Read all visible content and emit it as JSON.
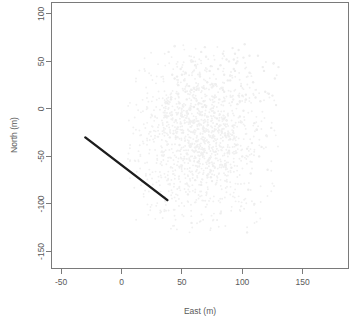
{
  "figure": {
    "background_color": "#ffffff",
    "frame_color": "#7a7a7a",
    "text_color": "#5a5a5a"
  },
  "chart_data": {
    "type": "scatter",
    "title": "",
    "subtitle": "",
    "xlabel": "East (m)",
    "ylabel": "North (m)",
    "xlim": [
      -58,
      188
    ],
    "ylim": [
      -168,
      112
    ],
    "xticks": [
      -50,
      0,
      50,
      100,
      150
    ],
    "xticklabels": [
      "-50",
      "0",
      "50",
      "100",
      "150"
    ],
    "yticks": [
      100,
      50,
      0,
      -50,
      -100,
      -150
    ],
    "yticklabels": [
      "100",
      "50",
      "0",
      "-50",
      "-100",
      "-150"
    ],
    "grid": false,
    "legend": null,
    "legend_position": "none",
    "frame": "box",
    "series": [
      {
        "name": "point-cloud",
        "type": "scatter",
        "color": "#ededed",
        "marker": "point",
        "marker_size": 1.2,
        "note": "very faint light-gray diffuse cloud of points",
        "x": [
          62,
          74,
          81,
          55,
          90,
          68,
          47,
          96,
          72,
          59,
          85,
          103,
          66,
          51,
          78,
          94,
          110,
          63,
          45,
          88,
          100,
          70,
          57,
          83,
          115,
          76,
          41,
          92,
          106,
          64,
          53,
          80,
          98,
          120,
          69,
          48,
          87,
          109,
          74,
          60,
          95,
          112,
          67,
          44,
          84,
          101,
          125,
          71,
          56,
          90,
          117,
          79,
          38,
          93,
          104,
          65,
          50,
          86,
          122,
          75,
          43,
          97,
          108,
          61,
          54,
          82,
          99,
          128,
          73,
          46,
          89,
          113,
          77,
          58,
          91,
          118,
          68,
          40,
          85,
          102,
          66,
          52,
          79,
          96,
          124,
          70,
          49,
          88,
          111,
          76,
          62,
          94,
          107,
          64,
          42,
          83,
          100,
          130,
          72,
          57,
          87,
          116,
          78,
          45,
          92,
          105,
          60,
          53,
          81,
          98,
          126,
          74,
          47,
          90,
          114,
          69,
          39,
          86,
          103,
          65,
          55,
          84,
          101,
          121,
          71,
          50,
          93,
          110,
          77,
          61,
          95,
          119,
          67,
          44,
          82,
          99,
          127,
          75,
          48,
          89,
          112,
          73,
          58,
          97,
          106,
          63,
          41,
          85,
          104,
          68
        ],
        "y": [
          20,
          45,
          10,
          -5,
          35,
          -20,
          25,
          5,
          -35,
          50,
          -10,
          15,
          60,
          -25,
          -45,
          40,
          -15,
          0,
          -30,
          30,
          -50,
          55,
          -40,
          22,
          8,
          -60,
          12,
          -18,
          38,
          -55,
          18,
          42,
          -8,
          -28,
          65,
          -38,
          -12,
          28,
          -65,
          2,
          48,
          -22,
          -48,
          32,
          58,
          -2,
          14,
          -70,
          24,
          -32,
          44,
          -16,
          6,
          52,
          -42,
          -6,
          36,
          -58,
          16,
          26,
          -26,
          62,
          -36,
          -75,
          10,
          46,
          -14,
          4,
          -52,
          34,
          -44,
          56,
          -4,
          20,
          -62,
          40,
          8,
          -30,
          18,
          68,
          -80,
          30,
          -10,
          50,
          -20,
          2,
          42,
          -46,
          12,
          24,
          -34,
          58,
          -68,
          6,
          36,
          -24,
          14,
          44,
          -54,
          0,
          52,
          -40,
          26,
          -12,
          64,
          -85,
          22,
          38,
          -18,
          8,
          48,
          -72,
          16,
          30,
          -50,
          4,
          60,
          -28,
          10,
          34,
          -90,
          20,
          54,
          -64,
          28,
          -8,
          42,
          -100,
          12,
          46,
          -38,
          18,
          2,
          66,
          -110,
          24,
          32,
          -76,
          6,
          50,
          -22,
          40,
          -120,
          14,
          56,
          -56,
          10,
          36,
          -130,
          22
        ],
        "x_range": [
          5,
          132
        ],
        "y_range": [
          -130,
          70
        ],
        "center": [
          62,
          -30
        ]
      },
      {
        "name": "transect-line",
        "type": "line",
        "color": "#1c1c1c",
        "linewidth": 2.4,
        "x": [
          -30,
          38
        ],
        "y": [
          -30,
          -96
        ]
      }
    ]
  }
}
